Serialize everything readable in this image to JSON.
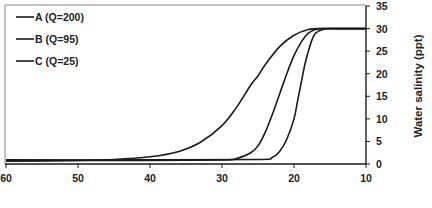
{
  "chart_data": {
    "type": "line",
    "title": "",
    "xlabel": "",
    "ylabel": "Water salinity (ppt)",
    "x_reversed": true,
    "xlim": [
      60,
      10
    ],
    "ylim": [
      0,
      35
    ],
    "x_ticks": [
      60,
      50,
      40,
      30,
      20,
      10
    ],
    "y_ticks": [
      0,
      5,
      10,
      15,
      20,
      25,
      30,
      35
    ],
    "y_axis_position": "right",
    "grid": false,
    "legend_position": "upper-left",
    "series": [
      {
        "name": "A (Q=200)",
        "x": [
          60,
          50,
          45,
          40,
          36,
          33,
          30,
          28,
          26,
          25,
          24,
          22,
          20,
          18,
          16,
          14,
          10
        ],
        "y": [
          0.6,
          0.8,
          1.0,
          1.6,
          2.8,
          4.8,
          8.5,
          12.5,
          17.5,
          19.5,
          22,
          26,
          28.5,
          29.8,
          30,
          30,
          30
        ]
      },
      {
        "name": "B (Q=95)",
        "x": [
          60,
          40,
          30,
          28,
          26,
          25,
          24,
          23,
          22,
          21,
          20,
          19,
          18,
          17,
          16,
          15,
          10
        ],
        "y": [
          0.8,
          0.8,
          0.9,
          1.2,
          2.5,
          4.0,
          7.0,
          11.0,
          15.5,
          20.0,
          24.0,
          27.0,
          29.0,
          29.8,
          30,
          30,
          30
        ]
      },
      {
        "name": "C (Q=25)",
        "x": [
          60,
          40,
          25,
          23,
          22,
          21,
          20,
          19.5,
          19,
          18.5,
          18,
          17.5,
          17,
          16,
          15,
          14,
          10
        ],
        "y": [
          0.9,
          0.9,
          1.0,
          1.5,
          2.8,
          5.5,
          10.0,
          14.0,
          18.0,
          22.0,
          25.0,
          27.5,
          29.0,
          29.8,
          30,
          30,
          30
        ]
      }
    ]
  },
  "legend": {
    "items": [
      {
        "label": "A (Q=200)"
      },
      {
        "label": "B (Q=95)"
      },
      {
        "label": "C (Q=25)"
      }
    ]
  },
  "axes": {
    "x_tick_labels": [
      "60",
      "50",
      "40",
      "30",
      "20",
      "10"
    ],
    "y_tick_labels": [
      "0",
      "5",
      "10",
      "15",
      "20",
      "25",
      "30",
      "35"
    ],
    "y_title": "Water salinity (ppt)"
  },
  "colors": {
    "line": "#1a1a1a",
    "text": "#222222",
    "frame": "#555555"
  }
}
